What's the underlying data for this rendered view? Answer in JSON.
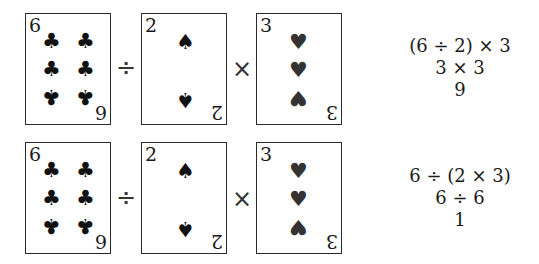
{
  "rows": [
    {
      "cards": [
        {
          "rank": "6",
          "suit": "clubs",
          "glyph": "♣"
        },
        {
          "rank": "2",
          "suit": "spades",
          "glyph": "♠"
        },
        {
          "rank": "3",
          "suit": "hearts",
          "glyph": "♥"
        }
      ],
      "operators": [
        "÷",
        "×"
      ],
      "steps": [
        "(6 ÷ 2) × 3",
        "3 × 3",
        "9"
      ]
    },
    {
      "cards": [
        {
          "rank": "6",
          "suit": "clubs",
          "glyph": "♣"
        },
        {
          "rank": "2",
          "suit": "spades",
          "glyph": "♠"
        },
        {
          "rank": "3",
          "suit": "hearts",
          "glyph": "♥"
        }
      ],
      "operators": [
        "÷",
        "×"
      ],
      "steps": [
        "6 ÷ (2 × 3)",
        "6 ÷ 6",
        "1"
      ]
    }
  ]
}
